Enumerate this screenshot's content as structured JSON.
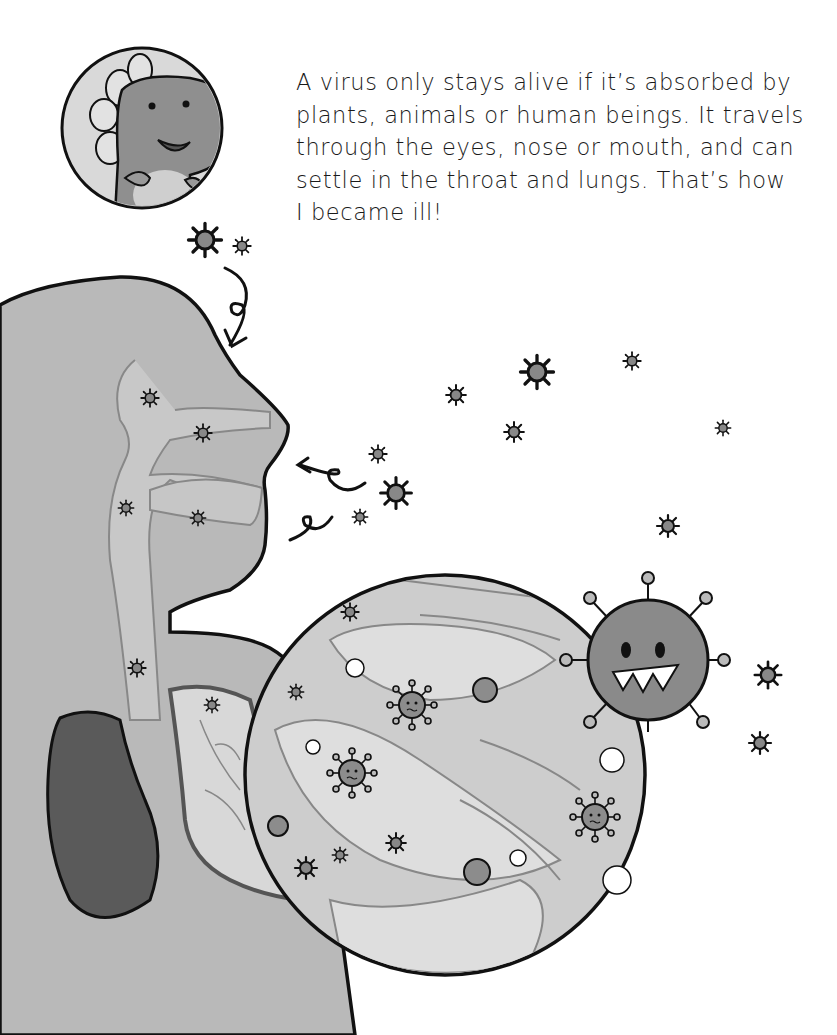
{
  "page": {
    "type": "illustrated-book-page",
    "palette": {
      "background": "#ffffff",
      "body_fill": "#b9b9b9",
      "body_shade": "#a0a0a0",
      "airway_fill": "#c8c8c8",
      "lung_dark": "#5a5a5a",
      "lung_light": "#d8d8d8",
      "zoom_circle_fill": "#cfcfcf",
      "virus_fill": "#8a8a8a",
      "outline": "#111111",
      "text": "#1a1a1a"
    }
  },
  "narration": {
    "lines": [
      "A virus only stays alive if it’s absorbed by",
      "plants, animals or human beings. It travels",
      "through the eyes, nose or mouth, and can",
      "settle in the throat and lungs. That’s how",
      "I became ill!"
    ]
  },
  "illustration": {
    "character_portrait": "dinosaur-character-smiling",
    "figure": "human-head-and-torso-cross-section",
    "zoom_lens": "magnified-lung-bronchi-with-viruses",
    "big_virus": "angry-coronavirus-with-teeth",
    "arrows": [
      "curly-arrow-into-head",
      "curly-arrow-into-nose",
      "curly-arrow-into-mouth"
    ]
  }
}
